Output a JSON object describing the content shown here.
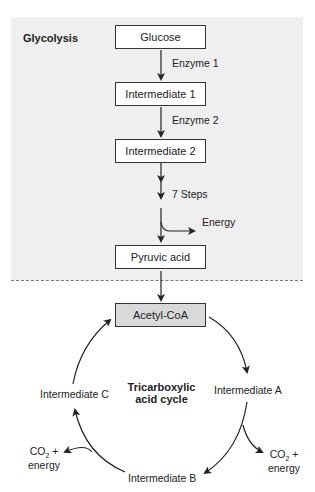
{
  "glycolysis": {
    "title": "Glycolysis",
    "steps": [
      {
        "label": "Glucose"
      },
      {
        "label": "Intermediate 1"
      },
      {
        "label": "Intermediate 2"
      },
      {
        "label": "Pyruvic acid"
      }
    ],
    "enzymes": [
      "Enzyme 1",
      "Enzyme 2"
    ],
    "seven_steps_label": "7 Steps",
    "energy_label": "Energy"
  },
  "tca": {
    "entry": "Acetyl-CoA",
    "title_line1": "Tricarboxylic",
    "title_line2": "acid cycle",
    "intermediates": {
      "a": "Intermediate A",
      "b": "Intermediate B",
      "c": "Intermediate C"
    },
    "outputs": {
      "right": {
        "co2": "CO",
        "sub": "2",
        "plus": " +",
        "energy": "energy"
      },
      "left": {
        "co2": "CO",
        "sub": "2",
        "plus": " +",
        "energy": "energy"
      }
    }
  },
  "colors": {
    "panel_bg": "#efefef",
    "acetyl_box": "#d9d9d9",
    "line": "#222222"
  }
}
